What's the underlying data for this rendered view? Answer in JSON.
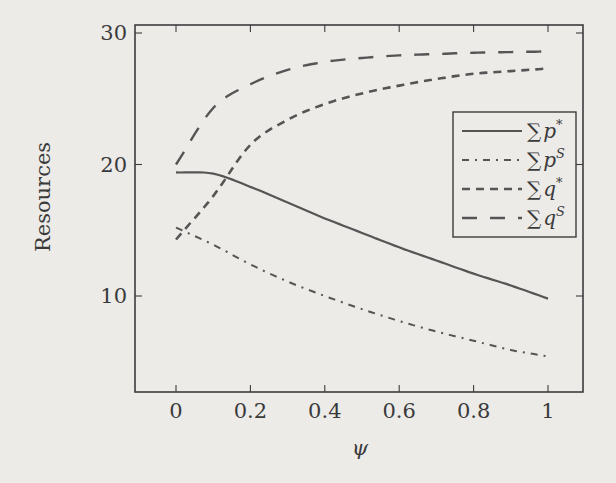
{
  "chart_data": {
    "type": "line",
    "title": "",
    "xlabel": "ψ",
    "ylabel": "Resources",
    "xlim": [
      -0.11,
      1.1
    ],
    "ylim": [
      2.7,
      30.6
    ],
    "xticks": [
      0,
      0.2,
      0.4,
      0.6,
      0.8,
      1
    ],
    "xtick_labels": [
      "0",
      "0.2",
      "0.4",
      "0.6",
      "0.8",
      "1"
    ],
    "yticks": [
      10,
      20,
      30
    ],
    "ytick_labels": [
      "10",
      "20",
      "30"
    ],
    "grid": false,
    "legend_position": "upper right (inside, mid-right)",
    "x": [
      0,
      0.1,
      0.2,
      0.3,
      0.4,
      0.5,
      0.6,
      0.7,
      0.8,
      0.9,
      1.0
    ],
    "series": [
      {
        "name": "∑p*",
        "base": "∑p",
        "sup": "*",
        "style": "solid",
        "dash": "",
        "width": 2.2,
        "values": [
          19.4,
          19.3,
          18.3,
          17.1,
          15.9,
          14.8,
          13.7,
          12.7,
          11.7,
          10.8,
          9.8
        ]
      },
      {
        "name": "∑p^S",
        "base": "∑p",
        "sup": "S",
        "style": "dash-dot",
        "dash": "7 6 2 6",
        "width": 2.0,
        "values": [
          15.2,
          13.9,
          12.4,
          11.1,
          10.0,
          9.0,
          8.1,
          7.3,
          6.6,
          5.9,
          5.4
        ]
      },
      {
        "name": "∑q*",
        "base": "∑q",
        "sup": "*",
        "style": "dashed",
        "dash": "8 6",
        "width": 2.6,
        "values": [
          14.3,
          17.6,
          21.5,
          23.4,
          24.6,
          25.4,
          26.0,
          26.5,
          26.9,
          27.1,
          27.3
        ]
      },
      {
        "name": "∑q^S",
        "base": "∑q",
        "sup": "S",
        "style": "long-dash",
        "dash": "15 13",
        "width": 2.4,
        "values": [
          20.0,
          24.3,
          26.1,
          27.2,
          27.8,
          28.1,
          28.3,
          28.4,
          28.5,
          28.55,
          28.6
        ]
      }
    ]
  },
  "colors": {
    "background": "#ecebe8",
    "axis": "#3c3c3c",
    "line": "#555555"
  }
}
